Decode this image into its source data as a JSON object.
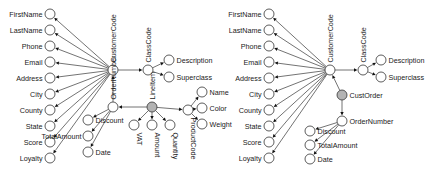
{
  "figure": {
    "type": "entity-relationship-graph-pair",
    "diagrams": [
      {
        "id": "left",
        "name": "line-item-model",
        "root_label": "CustomerCode",
        "nodes": [
          {
            "id": "firstname",
            "label": "FirstName",
            "kind": "attribute",
            "x": 50,
            "y": 14,
            "label_side": "left"
          },
          {
            "id": "lastname",
            "label": "LastName",
            "kind": "attribute",
            "x": 50,
            "y": 30,
            "label_side": "left"
          },
          {
            "id": "phone",
            "label": "Phone",
            "kind": "attribute",
            "x": 50,
            "y": 46,
            "label_side": "left"
          },
          {
            "id": "email",
            "label": "Email",
            "kind": "attribute",
            "x": 50,
            "y": 62,
            "label_side": "left"
          },
          {
            "id": "address",
            "label": "Address",
            "kind": "attribute",
            "x": 50,
            "y": 78,
            "label_side": "left"
          },
          {
            "id": "city",
            "label": "City",
            "kind": "attribute",
            "x": 50,
            "y": 94,
            "label_side": "left"
          },
          {
            "id": "county",
            "label": "County",
            "kind": "attribute",
            "x": 50,
            "y": 110,
            "label_side": "left"
          },
          {
            "id": "state",
            "label": "State",
            "kind": "attribute",
            "x": 50,
            "y": 126,
            "label_side": "left"
          },
          {
            "id": "score",
            "label": "Score",
            "kind": "attribute",
            "x": 50,
            "y": 142,
            "label_side": "left"
          },
          {
            "id": "loyalty",
            "label": "Loyalty",
            "kind": "attribute",
            "x": 50,
            "y": 158,
            "label_side": "left"
          },
          {
            "id": "customercode",
            "label": "CustomerCode",
            "kind": "entity",
            "x": 113,
            "y": 70,
            "label_side": "up"
          },
          {
            "id": "classcode",
            "label": "ClassCode",
            "kind": "entity",
            "x": 148,
            "y": 70,
            "label_side": "up"
          },
          {
            "id": "description",
            "label": "Description",
            "kind": "attribute",
            "x": 169,
            "y": 60,
            "label_side": "right"
          },
          {
            "id": "superclass",
            "label": "Superclass",
            "kind": "attribute",
            "x": 169,
            "y": 77,
            "label_side": "right"
          },
          {
            "id": "ordernumber",
            "label": "OrderNumber",
            "kind": "entity",
            "x": 113,
            "y": 107,
            "label_side": "up"
          },
          {
            "id": "lineitem",
            "label": "LineItem",
            "kind": "relation",
            "x": 152,
            "y": 107,
            "label_side": "up"
          },
          {
            "id": "discount",
            "label": "Discount",
            "kind": "attribute",
            "x": 88,
            "y": 120,
            "label_side": "right"
          },
          {
            "id": "totalamount",
            "label": "TotalAmount",
            "kind": "attribute",
            "x": 88,
            "y": 136,
            "label_side": "leftlow"
          },
          {
            "id": "date",
            "label": "Date",
            "kind": "attribute",
            "x": 88,
            "y": 152,
            "label_side": "right"
          },
          {
            "id": "vat",
            "label": "VAT",
            "kind": "attribute",
            "x": 134,
            "y": 125,
            "label_side": "down"
          },
          {
            "id": "amount",
            "label": "Amount",
            "kind": "attribute",
            "x": 152,
            "y": 125,
            "label_side": "down"
          },
          {
            "id": "quantity",
            "label": "Quantity",
            "kind": "attribute",
            "x": 170,
            "y": 125,
            "label_side": "down"
          },
          {
            "id": "productcode",
            "label": "ProductCode",
            "kind": "entity",
            "x": 188,
            "y": 110,
            "label_side": "down"
          },
          {
            "id": "name",
            "label": "Name",
            "kind": "attribute",
            "x": 202,
            "y": 92,
            "label_side": "right"
          },
          {
            "id": "color",
            "label": "Color",
            "kind": "attribute",
            "x": 202,
            "y": 108,
            "label_side": "right"
          },
          {
            "id": "weight",
            "label": "Weight",
            "kind": "attribute",
            "x": 202,
            "y": 124,
            "label_side": "right"
          }
        ],
        "edges": [
          {
            "from": "customercode",
            "to": "firstname"
          },
          {
            "from": "customercode",
            "to": "lastname"
          },
          {
            "from": "customercode",
            "to": "phone"
          },
          {
            "from": "customercode",
            "to": "email"
          },
          {
            "from": "customercode",
            "to": "address"
          },
          {
            "from": "customercode",
            "to": "city"
          },
          {
            "from": "customercode",
            "to": "county"
          },
          {
            "from": "customercode",
            "to": "state"
          },
          {
            "from": "customercode",
            "to": "score"
          },
          {
            "from": "customercode",
            "to": "loyalty"
          },
          {
            "from": "customercode",
            "to": "classcode"
          },
          {
            "from": "classcode",
            "to": "description"
          },
          {
            "from": "classcode",
            "to": "superclass"
          },
          {
            "from": "ordernumber",
            "to": "customercode"
          },
          {
            "from": "ordernumber",
            "to": "discount"
          },
          {
            "from": "ordernumber",
            "to": "totalamount"
          },
          {
            "from": "ordernumber",
            "to": "date"
          },
          {
            "from": "lineitem",
            "to": "ordernumber"
          },
          {
            "from": "lineitem",
            "to": "vat"
          },
          {
            "from": "lineitem",
            "to": "amount"
          },
          {
            "from": "lineitem",
            "to": "quantity"
          },
          {
            "from": "lineitem",
            "to": "productcode"
          },
          {
            "from": "productcode",
            "to": "name"
          },
          {
            "from": "productcode",
            "to": "color"
          },
          {
            "from": "productcode",
            "to": "weight"
          }
        ]
      },
      {
        "id": "right",
        "name": "cust-order-model",
        "root_label": "CustomerCode",
        "nodes": [
          {
            "id": "r_firstname",
            "label": "FirstName",
            "kind": "attribute",
            "x": 269,
            "y": 14,
            "label_side": "left"
          },
          {
            "id": "r_lastname",
            "label": "LastName",
            "kind": "attribute",
            "x": 269,
            "y": 30,
            "label_side": "left"
          },
          {
            "id": "r_phone",
            "label": "Phone",
            "kind": "attribute",
            "x": 269,
            "y": 46,
            "label_side": "left"
          },
          {
            "id": "r_email",
            "label": "Email",
            "kind": "attribute",
            "x": 269,
            "y": 62,
            "label_side": "left"
          },
          {
            "id": "r_address",
            "label": "Address",
            "kind": "attribute",
            "x": 269,
            "y": 78,
            "label_side": "left"
          },
          {
            "id": "r_city",
            "label": "City",
            "kind": "attribute",
            "x": 269,
            "y": 94,
            "label_side": "left"
          },
          {
            "id": "r_county",
            "label": "County",
            "kind": "attribute",
            "x": 269,
            "y": 110,
            "label_side": "left"
          },
          {
            "id": "r_state",
            "label": "State",
            "kind": "attribute",
            "x": 269,
            "y": 126,
            "label_side": "left"
          },
          {
            "id": "r_score",
            "label": "Score",
            "kind": "attribute",
            "x": 269,
            "y": 142,
            "label_side": "left"
          },
          {
            "id": "r_loyalty",
            "label": "Loyalty",
            "kind": "attribute",
            "x": 269,
            "y": 158,
            "label_side": "left"
          },
          {
            "id": "r_customercode",
            "label": "CustomerCode",
            "kind": "entity",
            "x": 330,
            "y": 70,
            "label_side": "up"
          },
          {
            "id": "r_classcode",
            "label": "ClassCode",
            "kind": "entity",
            "x": 363,
            "y": 70,
            "label_side": "up"
          },
          {
            "id": "r_description",
            "label": "Description",
            "kind": "attribute",
            "x": 381,
            "y": 60,
            "label_side": "right"
          },
          {
            "id": "r_superclass",
            "label": "Superclass",
            "kind": "attribute",
            "x": 381,
            "y": 77,
            "label_side": "right"
          },
          {
            "id": "r_custorder",
            "label": "CustOrder",
            "kind": "relation",
            "x": 342,
            "y": 95,
            "label_side": "right"
          },
          {
            "id": "r_ordernumber",
            "label": "OrderNumber",
            "kind": "entity",
            "x": 342,
            "y": 121,
            "label_side": "right"
          },
          {
            "id": "r_discount",
            "label": "Discount",
            "kind": "attribute",
            "x": 310,
            "y": 131,
            "label_side": "right"
          },
          {
            "id": "r_totalamount",
            "label": "TotalAmount",
            "kind": "attribute",
            "x": 310,
            "y": 145,
            "label_side": "right"
          },
          {
            "id": "r_date",
            "label": "Date",
            "kind": "attribute",
            "x": 310,
            "y": 159,
            "label_side": "right"
          }
        ],
        "edges": [
          {
            "from": "r_customercode",
            "to": "r_firstname"
          },
          {
            "from": "r_customercode",
            "to": "r_lastname"
          },
          {
            "from": "r_customercode",
            "to": "r_phone"
          },
          {
            "from": "r_customercode",
            "to": "r_email"
          },
          {
            "from": "r_customercode",
            "to": "r_address"
          },
          {
            "from": "r_customercode",
            "to": "r_city"
          },
          {
            "from": "r_customercode",
            "to": "r_county"
          },
          {
            "from": "r_customercode",
            "to": "r_state"
          },
          {
            "from": "r_customercode",
            "to": "r_score"
          },
          {
            "from": "r_customercode",
            "to": "r_loyalty"
          },
          {
            "from": "r_customercode",
            "to": "r_classcode"
          },
          {
            "from": "r_classcode",
            "to": "r_description"
          },
          {
            "from": "r_classcode",
            "to": "r_superclass"
          },
          {
            "from": "r_custorder",
            "to": "r_customercode"
          },
          {
            "from": "r_custorder",
            "to": "r_ordernumber"
          },
          {
            "from": "r_ordernumber",
            "to": "r_discount"
          },
          {
            "from": "r_ordernumber",
            "to": "r_totalamount"
          },
          {
            "from": "r_ordernumber",
            "to": "r_date"
          }
        ]
      }
    ],
    "colors": {
      "node_fill": "#ffffff",
      "relation_fill": "#b3b3b3",
      "stroke": "#333333",
      "text": "#1a1a1a",
      "background": "#ffffff"
    }
  }
}
